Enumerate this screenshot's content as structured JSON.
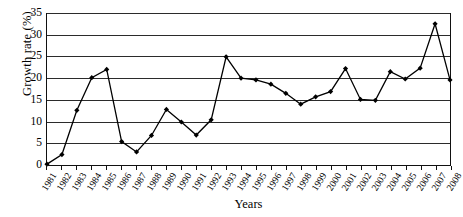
{
  "chart_data": {
    "type": "line",
    "title": "",
    "xlabel": "Years",
    "ylabel": "Growth rate (%)",
    "ylim": [
      0,
      35
    ],
    "yticks": [
      0,
      5,
      10,
      15,
      20,
      25,
      30,
      35
    ],
    "grid": true,
    "legend": false,
    "marker": "diamond",
    "line_color": "#000000",
    "categories": [
      "1981",
      "1982",
      "1983",
      "1984",
      "1985",
      "1986",
      "1987",
      "1988",
      "1989",
      "1990",
      "1991",
      "1992",
      "1993",
      "1994",
      "1995",
      "1996",
      "1997",
      "1998",
      "1999",
      "2000",
      "2001",
      "2002",
      "2003",
      "2004",
      "2005",
      "2006",
      "2007",
      "2008"
    ],
    "values": [
      0.2,
      2.4,
      12.6,
      20.1,
      22.0,
      5.4,
      3.0,
      6.8,
      12.8,
      9.9,
      6.9,
      10.4,
      24.9,
      20.0,
      19.6,
      18.6,
      16.5,
      14.0,
      15.7,
      16.9,
      22.2,
      15.1,
      14.9,
      21.5,
      19.8,
      22.3,
      32.5,
      19.6
    ]
  }
}
